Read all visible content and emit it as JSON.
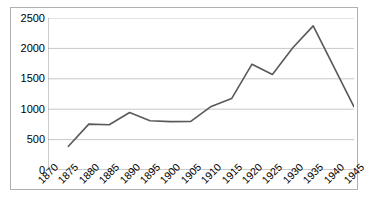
{
  "chart_data": {
    "type": "line",
    "title": "",
    "subtitle": "",
    "xlabel": "",
    "ylabel": "",
    "x": [
      1870,
      1875,
      1880,
      1885,
      1890,
      1895,
      1900,
      1905,
      1910,
      1915,
      1920,
      1925,
      1930,
      1935,
      1940,
      1945
    ],
    "categories": [
      "1870",
      "1875",
      "1880",
      "1885",
      "1890",
      "1895",
      "1900",
      "1905",
      "1910",
      "1915",
      "1920",
      "1925",
      "1930",
      "1935",
      "1940",
      "1945"
    ],
    "series": [
      {
        "name": "series-1",
        "x": [
          1875,
          1880,
          1885,
          1890,
          1895,
          1900,
          1905,
          1910,
          1915,
          1920,
          1925,
          1930,
          1935,
          1945
        ],
        "values": [
          390,
          755,
          745,
          945,
          810,
          795,
          800,
          1045,
          1175,
          1740,
          1570,
          2010,
          2370,
          1040
        ],
        "color": "#595959"
      }
    ],
    "ytick_labels": [
      "0",
      "500",
      "1000",
      "1500",
      "2000",
      "2500"
    ],
    "yticks": [
      0,
      500,
      1000,
      1500,
      2000,
      2500
    ],
    "ylim": [
      0,
      2500
    ],
    "xlim": [
      1870,
      1945
    ],
    "grid": "horizontal",
    "legend": "none",
    "line_color": "#595959",
    "grid_color": "#c8c8c8",
    "axis_color": "#999999",
    "plot_background": "#ffffff",
    "border_color": "#b0b0b0",
    "xtick_rotation": -45
  }
}
